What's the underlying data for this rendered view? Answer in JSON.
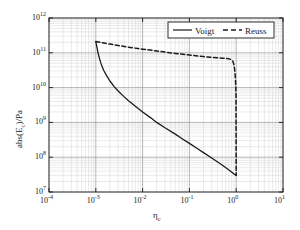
{
  "chart_data": {
    "type": "line",
    "title": "",
    "xlabel": "ηc",
    "xlabel_base": "η",
    "xlabel_sub": "c",
    "ylabel": "abs(Ec)/Pa",
    "ylabel_pre": "abs(E",
    "ylabel_sub": "c",
    "ylabel_post": ")/Pa",
    "xscale": "log",
    "yscale": "log",
    "xlim": [
      0.0001,
      10
    ],
    "ylim": [
      10000000,
      1000000000000
    ],
    "grid": true,
    "grid_minor": true,
    "legend_position": "top-right",
    "xticks": [
      {
        "value": 0.0001,
        "label_mantissa": "10",
        "label_exp": "-4"
      },
      {
        "value": 0.001,
        "label_mantissa": "10",
        "label_exp": "-3"
      },
      {
        "value": 0.01,
        "label_mantissa": "10",
        "label_exp": "-2"
      },
      {
        "value": 0.1,
        "label_mantissa": "10",
        "label_exp": "-1"
      },
      {
        "value": 1,
        "label_mantissa": "10",
        "label_exp": "0"
      },
      {
        "value": 10,
        "label_mantissa": "10",
        "label_exp": "1"
      }
    ],
    "yticks": [
      {
        "value": 10000000,
        "label_mantissa": "10",
        "label_exp": "7"
      },
      {
        "value": 100000000,
        "label_mantissa": "10",
        "label_exp": "8"
      },
      {
        "value": 1000000000,
        "label_mantissa": "10",
        "label_exp": "9"
      },
      {
        "value": 10000000000,
        "label_mantissa": "10",
        "label_exp": "10"
      },
      {
        "value": 100000000000,
        "label_mantissa": "10",
        "label_exp": "11"
      },
      {
        "value": 1000000000000,
        "label_mantissa": "10",
        "label_exp": "12"
      }
    ],
    "series": [
      {
        "name": "Voigt",
        "style": "solid",
        "color": "#1a1a1a",
        "points": [
          [
            0.001,
            210000000000.0
          ],
          [
            0.00105,
            150000000000.0
          ],
          [
            0.0011,
            110000000000.0
          ],
          [
            0.00115,
            85000000000.0
          ],
          [
            0.0012,
            68000000000.0
          ],
          [
            0.0013,
            48000000000.0
          ],
          [
            0.0014,
            37000000000.0
          ],
          [
            0.0015,
            30000000000.0
          ],
          [
            0.0017,
            22000000000.0
          ],
          [
            0.002,
            15500000000.0
          ],
          [
            0.0025,
            10500000000.0
          ],
          [
            0.003,
            8000000000.0
          ],
          [
            0.004,
            5500000000.0
          ],
          [
            0.005,
            4200000000.0
          ],
          [
            0.007,
            2900000000.0
          ],
          [
            0.01,
            2000000000.0
          ],
          [
            0.015,
            1350000000.0
          ],
          [
            0.02,
            1000000000.0
          ],
          [
            0.03,
            700000000.0
          ],
          [
            0.05,
            460000000.0
          ],
          [
            0.07,
            340000000.0
          ],
          [
            0.1,
            250000000.0
          ],
          [
            0.15,
            175000000.0
          ],
          [
            0.2,
            135000000.0
          ],
          [
            0.3,
            95000000.0
          ],
          [
            0.5,
            60000000.0
          ],
          [
            0.7,
            43000000.0
          ],
          [
            0.9,
            33000000.0
          ],
          [
            1.0,
            30000000.0
          ]
        ]
      },
      {
        "name": "Reuss",
        "style": "dashed",
        "color": "#1a1a1a",
        "points": [
          [
            0.001,
            210000000000.0
          ],
          [
            0.0015,
            190000000000.0
          ],
          [
            0.002,
            178000000000.0
          ],
          [
            0.003,
            162000000000.0
          ],
          [
            0.005,
            145000000000.0
          ],
          [
            0.008,
            132000000000.0
          ],
          [
            0.01,
            127000000000.0
          ],
          [
            0.02,
            113000000000.0
          ],
          [
            0.03,
            105000000000.0
          ],
          [
            0.05,
            96000000000.0
          ],
          [
            0.08,
            89000000000.0
          ],
          [
            0.1,
            86000000000.0
          ],
          [
            0.15,
            81000000000.0
          ],
          [
            0.2,
            78000000000.0
          ],
          [
            0.3,
            74000000000.0
          ],
          [
            0.4,
            71500000000.0
          ],
          [
            0.5,
            70000000000.0
          ],
          [
            0.6,
            68500000000.0
          ],
          [
            0.7,
            67000000000.0
          ],
          [
            0.78,
            64000000000.0
          ],
          [
            0.84,
            58000000000.0
          ],
          [
            0.88,
            49000000000.0
          ],
          [
            0.91,
            39000000000.0
          ],
          [
            0.94,
            28000000000.0
          ],
          [
            0.96,
            19000000000.0
          ],
          [
            0.98,
            11000000000.0
          ],
          [
            0.99,
            6000000000.0
          ],
          [
            1.0,
            30000000.0
          ]
        ]
      }
    ],
    "legend": [
      {
        "label": "Voigt",
        "style": "solid"
      },
      {
        "label": "Reuss",
        "style": "dashed"
      }
    ]
  },
  "colors": {
    "axis": "#1a1a1a",
    "grid_major": "#9a9a9a",
    "grid_minor": "#cfcfcf",
    "curve": "#1a1a1a",
    "background": "#ffffff"
  }
}
